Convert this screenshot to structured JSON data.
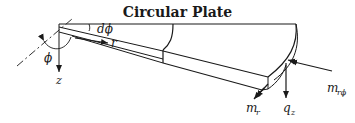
{
  "title": "Circular Plate",
  "labels": {
    "dphi": "dϕ",
    "r": "r",
    "phi": "ϕ",
    "z": "z",
    "m_r": "m",
    "m_r_sub": "r",
    "q_z": "q",
    "q_z_sub": "z",
    "m_rphi": "m",
    "m_rphi_sub": "rϕ"
  },
  "colors": {
    "stroke": "#1a1a1a",
    "background": "#ffffff"
  }
}
